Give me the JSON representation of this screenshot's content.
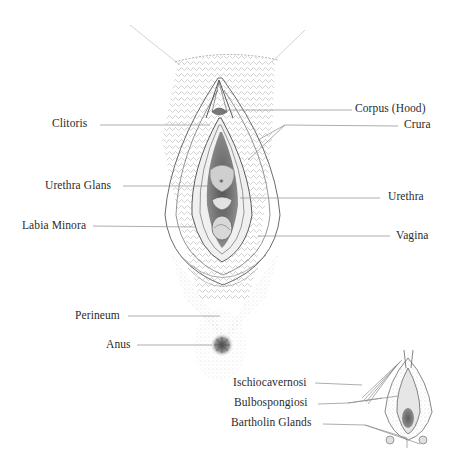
{
  "diagram": {
    "type": "anatomical-illustration",
    "style": "pencil line drawing, grayscale on white",
    "main_figure": {
      "labels_left": [
        {
          "id": "clitoris",
          "text": "Clitoris"
        },
        {
          "id": "urethra-glans",
          "text": "Urethra Glans"
        },
        {
          "id": "labia-minora",
          "text": "Labia Minora"
        },
        {
          "id": "perineum",
          "text": "Perineum"
        },
        {
          "id": "anus",
          "text": "Anus"
        }
      ],
      "labels_right": [
        {
          "id": "corpus-hood",
          "text": "Corpus (Hood)"
        },
        {
          "id": "crura",
          "text": "Crura"
        },
        {
          "id": "urethra",
          "text": "Urethra"
        },
        {
          "id": "vagina",
          "text": "Vagina"
        }
      ]
    },
    "inset_figure": {
      "labels": [
        {
          "id": "ischiocavernosi",
          "text": "Ischiocavernosi"
        },
        {
          "id": "bulbospongiosi",
          "text": "Bulbospongiosi"
        },
        {
          "id": "bartholin-glands",
          "text": "Bartholin Glands"
        }
      ]
    },
    "colors": {
      "background": "#ffffff",
      "line": "#555555",
      "leader": "#8a8a8a",
      "text": "#2b2b2b"
    }
  }
}
